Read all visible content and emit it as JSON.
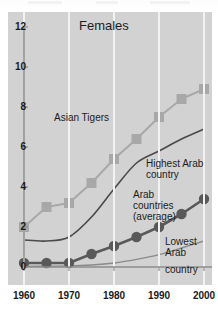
{
  "chart_data": {
    "type": "line",
    "title": "Females",
    "xlabel": "",
    "ylabel": "",
    "xlim": [
      1960,
      2000
    ],
    "ylim": [
      0,
      12
    ],
    "grid": "vertical white gridlines at decades",
    "legend": "inline annotations",
    "x_ticks": [
      "1960",
      "1970",
      "1980",
      "1990",
      "2000"
    ],
    "x_tick_values": [
      1960,
      1970,
      1980,
      1990,
      2000
    ],
    "y_ticks": [
      "0",
      "2",
      "4",
      "6",
      "8",
      "10",
      "12"
    ],
    "y_tick_values": [
      0,
      2,
      4,
      6,
      8,
      10,
      12
    ],
    "x": [
      1960,
      1965,
      1970,
      1975,
      1980,
      1985,
      1990,
      1995,
      2000
    ],
    "series": [
      {
        "name": "Asian Tigers",
        "marker": "square",
        "color": "#a8a8a8",
        "values": [
          2.0,
          3.0,
          3.2,
          4.2,
          5.4,
          6.4,
          7.5,
          8.4,
          8.9
        ]
      },
      {
        "name": "Highest Arab country",
        "marker": "none",
        "color": "#4a4a4a",
        "values": [
          1.35,
          1.3,
          1.5,
          2.5,
          3.9,
          5.2,
          5.8,
          6.4,
          6.9
        ]
      },
      {
        "name": "Arab countries (average)",
        "marker": "circle",
        "color": "#595959",
        "values": [
          0.2,
          0.2,
          0.2,
          0.65,
          1.05,
          1.5,
          2.0,
          2.65,
          3.4
        ]
      },
      {
        "name": "Lowest Arab country",
        "marker": "none",
        "color": "#8a8a8a",
        "values": [
          0.03,
          0.04,
          0.05,
          0.1,
          0.2,
          0.38,
          0.62,
          0.95,
          1.3
        ]
      }
    ],
    "annotations": [
      {
        "key": "asian_tigers",
        "text": "Asian Tigers"
      },
      {
        "key": "highest_arab_l1",
        "text": "Highest Arab"
      },
      {
        "key": "highest_arab_l2",
        "text": "country"
      },
      {
        "key": "arab_avg_l1",
        "text": "Arab"
      },
      {
        "key": "arab_avg_l2",
        "text": "countries"
      },
      {
        "key": "arab_avg_l3",
        "text": "(average)"
      },
      {
        "key": "lowest_arab_l1",
        "text": "Lowest"
      },
      {
        "key": "lowest_arab_l2",
        "text": "Arab"
      },
      {
        "key": "lowest_arab_l3",
        "text": "country"
      }
    ]
  },
  "colors": {
    "panel_background": "#d2d2d2",
    "gridline": "#f2f2f2",
    "axis": "#8d8d8d",
    "asian_tigers": "#a8a8a8",
    "highest_arab": "#4a4a4a",
    "arab_average": "#595959",
    "lowest_arab": "#8a8a8a",
    "text": "#1c1c1c",
    "page_background": "#ffffff"
  }
}
